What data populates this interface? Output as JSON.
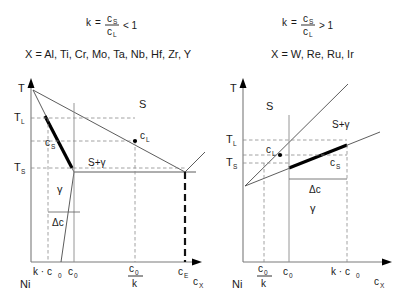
{
  "panels": [
    {
      "id": "left",
      "formula": {
        "k": "k",
        "equals": "=",
        "numerator": "c",
        "numerator_sub": "S",
        "denominator": "c",
        "denominator_sub": "L",
        "comparison": "< 1"
      },
      "elements_label": "X = Al, Ti, Cr, Mo, Ta, Nb, Hf, Zr, Y",
      "axis": {
        "y_label": "T",
        "x_label": "c",
        "x_label_sub": "X",
        "origin_label": "Ni"
      },
      "temperatures": [
        {
          "name": "T_L",
          "base": "T",
          "sub": "L"
        },
        {
          "name": "T_S",
          "base": "T",
          "sub": "S"
        }
      ],
      "phase_regions": [
        {
          "label": "S"
        },
        {
          "label": "S+γ"
        },
        {
          "label": "γ"
        }
      ],
      "point_labels": [
        {
          "base": "c",
          "sub": "L"
        },
        {
          "base": "c",
          "sub": "S"
        }
      ],
      "delta_label": "Δc",
      "x_ticks": [
        {
          "display": "k · c",
          "sub": "0",
          "type": "plain"
        },
        {
          "display": "c",
          "sub": "0",
          "type": "plain"
        },
        {
          "display": "c",
          "sub": "0",
          "type": "fraction",
          "denominator": "k"
        },
        {
          "display": "c",
          "sub": "E",
          "type": "plain"
        }
      ]
    },
    {
      "id": "right",
      "formula": {
        "k": "k",
        "equals": "=",
        "numerator": "c",
        "numerator_sub": "S",
        "denominator": "c",
        "denominator_sub": "L",
        "comparison": "> 1"
      },
      "elements_label": "X = W, Re, Ru, Ir",
      "axis": {
        "y_label": "T",
        "x_label": "c",
        "x_label_sub": "X",
        "origin_label": "Ni"
      },
      "temperatures": [
        {
          "name": "T_L",
          "base": "T",
          "sub": "L"
        },
        {
          "name": "T_S",
          "base": "T",
          "sub": "S"
        }
      ],
      "phase_regions": [
        {
          "label": "S"
        },
        {
          "label": "S+γ"
        },
        {
          "label": "γ"
        }
      ],
      "point_labels": [
        {
          "base": "c",
          "sub": "L"
        },
        {
          "base": "c",
          "sub": "S"
        }
      ],
      "delta_label": "Δc",
      "x_ticks": [
        {
          "display": "c",
          "sub": "0",
          "type": "fraction",
          "denominator": "k"
        },
        {
          "display": "c",
          "sub": "0",
          "type": "plain"
        },
        {
          "display": "k · c",
          "sub": "0",
          "type": "plain"
        }
      ]
    }
  ],
  "colors": {
    "line": "#4a4a4a",
    "axis": "#7a7a7a",
    "thick": "#000000",
    "dash": "#8a8a8a",
    "text": "#1a1a1a",
    "background": "#ffffff"
  }
}
